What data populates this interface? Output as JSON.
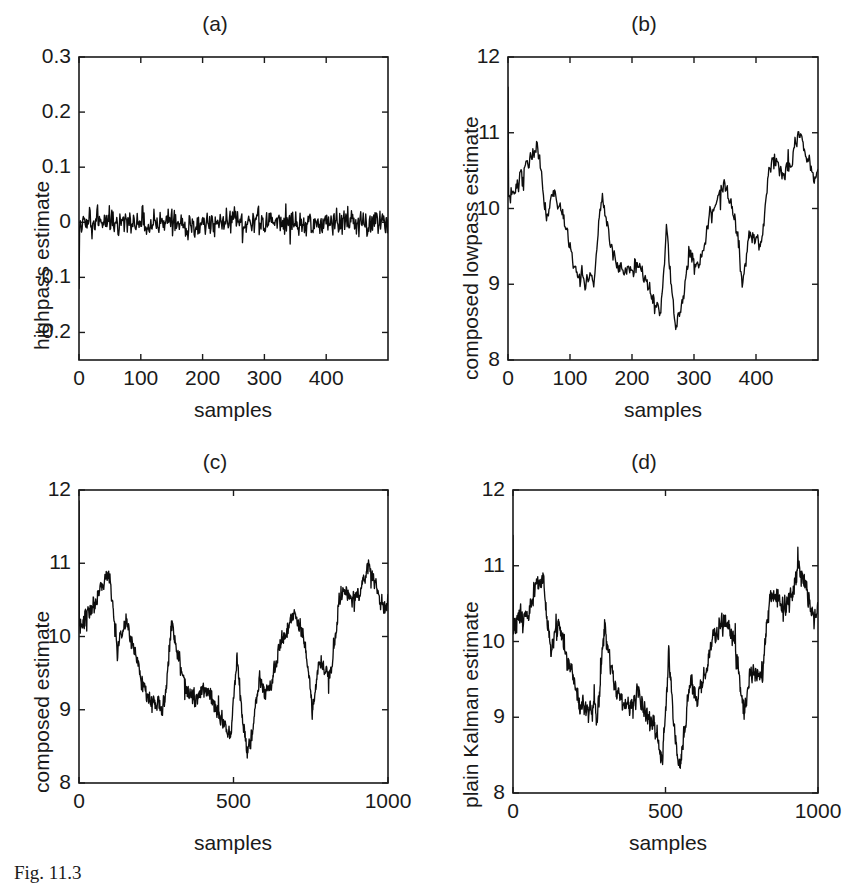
{
  "figure": {
    "caption": "Fig. 11.3",
    "background": "#ffffff",
    "line_color": "#0d0d0d",
    "axis_color": "#1a1a1a"
  },
  "chart_data": [
    {
      "id": "a",
      "type": "line",
      "title": "(a)",
      "xlabel": "samples",
      "ylabel": "highpass estimate",
      "xlim": [
        0,
        500
      ],
      "ylim": [
        -0.25,
        0.3
      ],
      "xticks": [
        0,
        100,
        200,
        300,
        400
      ],
      "xticklabels": [
        "0",
        "100",
        "200",
        "300",
        "400"
      ],
      "yticks": [
        0.3,
        0.2,
        0.1,
        0,
        -0.1,
        -0.2
      ],
      "yticklabels": [
        "0.3",
        "0.2",
        "0.1",
        "0",
        "-0.1",
        "-0.2"
      ],
      "grid": false,
      "legend": null,
      "series": [
        {
          "name": "highpass estimate",
          "n_points": 500,
          "kind": "white-noise",
          "mean": 0.0,
          "noise": 0.012,
          "spike_start": -0.12,
          "seed": 7741
        }
      ]
    },
    {
      "id": "b",
      "type": "line",
      "title": "(b)",
      "xlabel": "samples",
      "ylabel": "composed lowpass estimate",
      "xlim": [
        0,
        500
      ],
      "ylim": [
        8,
        12
      ],
      "xticks": [
        0,
        100,
        200,
        300,
        400
      ],
      "xticklabels": [
        "0",
        "100",
        "200",
        "300",
        "400"
      ],
      "yticks": [
        12,
        11,
        10,
        9,
        8
      ],
      "yticklabels": [
        "12",
        "11",
        "10",
        "9",
        "8"
      ],
      "grid": false,
      "legend": null,
      "series": [
        {
          "name": "composed lowpass estimate",
          "n_points": 500,
          "kind": "kalman-walk",
          "seed": 1907,
          "noise": 0.055,
          "spike_start": 11.6,
          "knots_x": [
            0,
            10,
            25,
            40,
            50,
            62,
            75,
            90,
            110,
            125,
            138,
            150,
            160,
            175,
            190,
            205,
            218,
            232,
            245,
            255,
            262,
            272,
            282,
            292,
            302,
            312,
            325,
            338,
            348,
            358,
            368,
            378,
            388,
            398,
            408,
            420,
            432,
            442,
            455,
            468,
            480,
            492,
            500
          ],
          "knots_y": [
            10.1,
            10.25,
            10.45,
            10.75,
            10.78,
            9.85,
            10.25,
            9.8,
            9.15,
            9.1,
            9.05,
            10.2,
            9.75,
            9.25,
            9.15,
            9.3,
            9.1,
            8.85,
            8.6,
            9.7,
            9.1,
            8.4,
            8.85,
            9.45,
            9.2,
            9.4,
            9.9,
            10.15,
            10.35,
            10.1,
            9.75,
            9.0,
            9.65,
            9.55,
            9.55,
            10.5,
            10.65,
            10.45,
            10.6,
            11.0,
            10.7,
            10.4,
            10.45
          ]
        }
      ]
    },
    {
      "id": "c",
      "type": "line",
      "title": "(c)",
      "xlabel": "samples",
      "ylabel": "composed estimate",
      "xlim": [
        0,
        1000
      ],
      "ylim": [
        8,
        12
      ],
      "xticks": [
        0,
        500,
        1000
      ],
      "xticklabels": [
        "0",
        "500",
        "1000"
      ],
      "yticks": [
        12,
        11,
        10,
        9,
        8
      ],
      "yticklabels": [
        "12",
        "11",
        "10",
        "9",
        "8"
      ],
      "grid": false,
      "legend": null,
      "series": [
        {
          "name": "composed estimate",
          "n_points": 1000,
          "kind": "kalman-walk",
          "seed": 1907,
          "noise": 0.055,
          "spike_start": 11.85,
          "knots_x": [
            0,
            20,
            50,
            80,
            100,
            124,
            150,
            180,
            220,
            250,
            276,
            300,
            320,
            350,
            380,
            410,
            436,
            464,
            490,
            510,
            524,
            544,
            564,
            584,
            604,
            624,
            650,
            676,
            696,
            716,
            736,
            756,
            776,
            796,
            816,
            840,
            864,
            884,
            910,
            936,
            960,
            984,
            1000
          ],
          "knots_y": [
            10.1,
            10.25,
            10.45,
            10.75,
            10.78,
            9.85,
            10.25,
            9.8,
            9.15,
            9.1,
            9.05,
            10.2,
            9.75,
            9.25,
            9.15,
            9.3,
            9.1,
            8.85,
            8.6,
            9.7,
            9.1,
            8.4,
            8.85,
            9.45,
            9.2,
            9.4,
            9.9,
            10.15,
            10.35,
            10.1,
            9.75,
            9.0,
            9.65,
            9.55,
            9.55,
            10.5,
            10.65,
            10.45,
            10.6,
            11.0,
            10.7,
            10.4,
            10.45
          ]
        }
      ]
    },
    {
      "id": "d",
      "type": "line",
      "title": "(d)",
      "xlabel": "samples",
      "ylabel": "plain Kalman estimate",
      "xlim": [
        0,
        1000
      ],
      "ylim": [
        8,
        12
      ],
      "xticks": [
        0,
        500,
        1000
      ],
      "xticklabels": [
        "0",
        "500",
        "1000"
      ],
      "yticks": [
        12,
        11,
        10,
        9,
        8
      ],
      "yticklabels": [
        "12",
        "11",
        "10",
        "9",
        "8"
      ],
      "grid": false,
      "legend": null,
      "series": [
        {
          "name": "plain Kalman estimate",
          "n_points": 1000,
          "kind": "kalman-walk",
          "seed": 4231,
          "noise": 0.062,
          "spike_start": 11.4,
          "knots_x": [
            0,
            20,
            50,
            80,
            100,
            124,
            150,
            180,
            220,
            250,
            276,
            300,
            320,
            350,
            380,
            410,
            436,
            464,
            490,
            510,
            524,
            544,
            564,
            584,
            604,
            624,
            650,
            676,
            696,
            716,
            736,
            756,
            776,
            796,
            816,
            840,
            864,
            884,
            910,
            936,
            960,
            984,
            1000
          ],
          "knots_y": [
            10.1,
            10.3,
            10.4,
            10.8,
            10.75,
            9.85,
            10.25,
            9.75,
            9.2,
            9.15,
            9.05,
            10.2,
            9.7,
            9.2,
            9.1,
            9.35,
            9.05,
            8.9,
            8.45,
            9.8,
            9.05,
            8.3,
            8.95,
            9.5,
            9.25,
            9.5,
            9.95,
            10.15,
            10.3,
            10.1,
            9.7,
            9.05,
            9.6,
            9.6,
            9.5,
            10.55,
            10.6,
            10.4,
            10.65,
            11.0,
            10.7,
            10.35,
            10.4
          ]
        }
      ]
    }
  ]
}
